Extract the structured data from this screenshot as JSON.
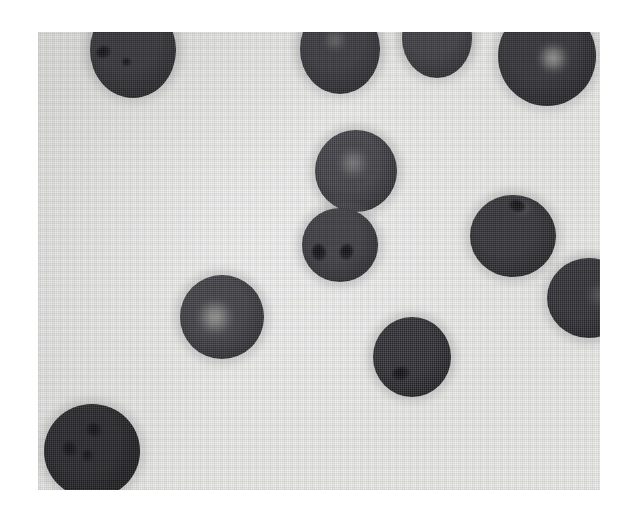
{
  "figure": {
    "kind": "micrograph",
    "caption": "",
    "background_color": "#ffffff",
    "field_color": "#f1f1f0",
    "plate": {
      "x": 38,
      "y": 32,
      "width": 562,
      "height": 458
    }
  },
  "palette": {
    "page_white": "#ffffff",
    "field_light": "#f1f1f0",
    "cell_dark": "#2b2b2e",
    "cell_darkest": "#141416",
    "cell_mid": "#4a4a4d",
    "granule_black": "#08080a",
    "highlight_light": "#c9c9c4"
  },
  "specimen": {
    "object_count": 11,
    "objects": [
      {
        "id": "cell-1",
        "label": "top-left cell (clipped at top edge)",
        "x": 52,
        "y": -30,
        "w": 86,
        "h": 96,
        "tone": "#303034",
        "edge": "#1d1d20",
        "highlight": null,
        "granules": [
          {
            "x": 0.16,
            "y": 0.52,
            "w": 15,
            "h": 12,
            "rot": -20
          },
          {
            "x": 0.42,
            "y": 0.62,
            "w": 9,
            "h": 8,
            "rot": 10
          }
        ]
      },
      {
        "id": "cell-2",
        "label": "top-center-left cell (clipped at top edge)",
        "x": 262,
        "y": -28,
        "w": 80,
        "h": 90,
        "tone": "#34343a",
        "edge": "#212125",
        "highlight": {
          "x": 0.44,
          "y": 0.4,
          "w": 26,
          "h": 20,
          "color": "rgba(190,190,186,.42)"
        },
        "granules": []
      },
      {
        "id": "cell-3",
        "label": "top-center-right cell (clipped at top edge)",
        "x": 364,
        "y": -34,
        "w": 70,
        "h": 80,
        "tone": "#3a3a40",
        "edge": "#242428",
        "highlight": null,
        "granules": []
      },
      {
        "id": "cell-4",
        "label": "top-right cell with bright vacuole (clipped at top edge)",
        "x": 460,
        "y": -26,
        "w": 98,
        "h": 100,
        "tone": "#2e2e33",
        "edge": "#1b1b1e",
        "highlight": {
          "x": 0.56,
          "y": 0.52,
          "w": 34,
          "h": 28,
          "color": "rgba(214,214,208,.72)"
        },
        "granules": []
      },
      {
        "id": "cell-5",
        "label": "central upper cell with bright core",
        "x": 277,
        "y": 98,
        "w": 82,
        "h": 82,
        "tone": "#3e3e44",
        "edge": "#252529",
        "highlight": {
          "x": 0.46,
          "y": 0.4,
          "w": 34,
          "h": 28,
          "color": "rgba(186,186,181,.55)"
        },
        "granules": []
      },
      {
        "id": "cell-6",
        "label": "central lower cell with two dark granules",
        "x": 264,
        "y": 176,
        "w": 76,
        "h": 74,
        "tone": "#39393f",
        "edge": "#222226",
        "highlight": null,
        "granules": [
          {
            "x": 0.22,
            "y": 0.6,
            "w": 14,
            "h": 17,
            "rot": -15
          },
          {
            "x": 0.58,
            "y": 0.6,
            "w": 13,
            "h": 16,
            "rot": 12
          }
        ]
      },
      {
        "id": "cell-7",
        "label": "right cell with dark ring granule",
        "x": 432,
        "y": 163,
        "w": 86,
        "h": 82,
        "tone": "#2f2f34",
        "edge": "#1c1c1f",
        "highlight": {
          "x": 0.6,
          "y": 0.16,
          "w": 20,
          "h": 14,
          "color": "rgba(170,170,166,.40)"
        },
        "granules": [
          {
            "x": 0.55,
            "y": 0.14,
            "w": 17,
            "h": 12,
            "rot": 20
          }
        ]
      },
      {
        "id": "cell-8",
        "label": "right edge cell (clipped at right edge)",
        "x": 509,
        "y": 226,
        "w": 84,
        "h": 80,
        "tone": "#2d2d32",
        "edge": "#1a1a1d",
        "highlight": {
          "x": 0.62,
          "y": 0.46,
          "w": 26,
          "h": 24,
          "color": "rgba(160,160,156,.35)"
        },
        "granules": []
      },
      {
        "id": "cell-9",
        "label": "left-center cell with strong bright highlight",
        "x": 142,
        "y": 243,
        "w": 84,
        "h": 84,
        "tone": "#3c3c42",
        "edge": "#242428",
        "highlight": {
          "x": 0.42,
          "y": 0.5,
          "w": 40,
          "h": 34,
          "color": "rgba(206,206,200,.70)"
        },
        "granules": []
      },
      {
        "id": "cell-10",
        "label": "lower-center cell with basal granule",
        "x": 335,
        "y": 285,
        "w": 78,
        "h": 80,
        "tone": "#2d2d32",
        "edge": "#1a1a1d",
        "highlight": null,
        "granules": [
          {
            "x": 0.36,
            "y": 0.7,
            "w": 18,
            "h": 13,
            "rot": -10
          }
        ]
      },
      {
        "id": "cell-11",
        "label": "bottom-left large dark cell",
        "x": 6,
        "y": 372,
        "w": 96,
        "h": 94,
        "tone": "#222226",
        "edge": "#121214",
        "highlight": null,
        "granules": [
          {
            "x": 0.52,
            "y": 0.28,
            "w": 16,
            "h": 14,
            "rot": 25
          },
          {
            "x": 0.27,
            "y": 0.48,
            "w": 14,
            "h": 16,
            "rot": -30
          },
          {
            "x": 0.45,
            "y": 0.55,
            "w": 11,
            "h": 11,
            "rot": 0
          }
        ]
      }
    ]
  }
}
